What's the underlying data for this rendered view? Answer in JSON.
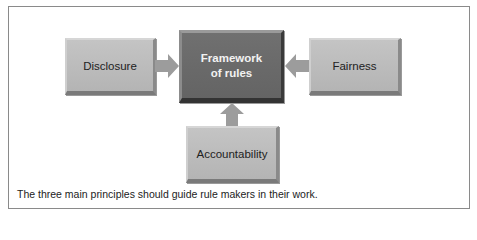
{
  "diagram": {
    "center": {
      "label_line1": "Framework",
      "label_line2": "of rules"
    },
    "left": {
      "label": "Disclosure"
    },
    "right": {
      "label": "Fairness"
    },
    "bottom": {
      "label": "Accountability"
    },
    "arrows": [
      {
        "from": "Disclosure",
        "to": "Framework of rules"
      },
      {
        "from": "Fairness",
        "to": "Framework of rules"
      },
      {
        "from": "Accountability",
        "to": "Framework of rules"
      }
    ],
    "colors": {
      "main_box": "#6a6a6a",
      "side_box": "#bcbcbc",
      "arrow": "#999999"
    }
  },
  "caption": "The three main principles should guide rule makers in their work."
}
